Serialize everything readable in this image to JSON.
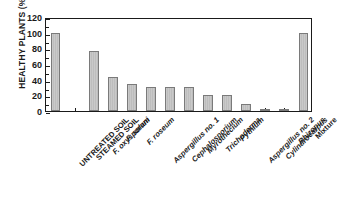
{
  "chart_data": {
    "type": "bar",
    "title": "",
    "xlabel": "",
    "ylabel": "HEALTHY PLANTS (%)",
    "ylim": [
      0,
      120
    ],
    "yticks": [
      0,
      20,
      40,
      60,
      80,
      100,
      120
    ],
    "ytick_labels": [
      "0",
      "20",
      "40",
      "60",
      "80",
      "100",
      "120"
    ],
    "minor_tick_step": 10,
    "grid": false,
    "legend": null,
    "categories": [
      "UNTREATED SOIL",
      "STEAMED SOIL",
      "F. oxysporum",
      "F. solani",
      "F. roseum",
      "Aspergillus no. 1",
      "Cephalosporium",
      "Myrothecium",
      "Trichoderma",
      "Pythium",
      "Aspergillus no. 2",
      "Cylindrocarpus",
      "Rhizopus",
      "Mixture"
    ],
    "category_styles": [
      "plain",
      "plain",
      "italic",
      "italic",
      "italic",
      "italic",
      "italic",
      "italic",
      "italic",
      "italic",
      "italic",
      "italic",
      "italic",
      "plain"
    ],
    "values": [
      100,
      0,
      76,
      43,
      35,
      31,
      31,
      31,
      21,
      21,
      9,
      1,
      1,
      100
    ],
    "bar_facecolor": "#c6c6c6",
    "bar_edgecolor": "#7a7a7a",
    "axis_color": "#1a1a1a",
    "background": "#ffffff"
  }
}
